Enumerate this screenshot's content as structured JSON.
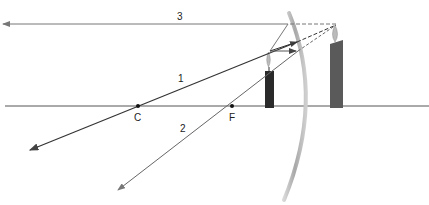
{
  "diagram": {
    "type": "concave-mirror-ray-diagram",
    "labels": {
      "ray1": "1",
      "ray2": "2",
      "ray3": "3",
      "center": "C",
      "focal": "F"
    },
    "colors": {
      "axis": "#555555",
      "ray1": "#333333",
      "ray2": "#666666",
      "ray3": "#777777",
      "mirror": "#bdbdbd",
      "candle_object": "#2a2a2a",
      "candle_image": "#555555"
    }
  }
}
